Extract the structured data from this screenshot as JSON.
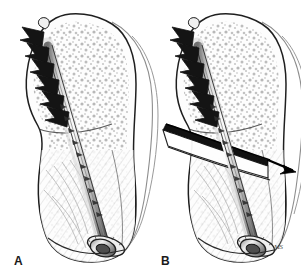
{
  "figure": {
    "background_color": "#ffffff",
    "ink_color": "#1a1a1a",
    "cancellous_stipple_color": "#9a9a9a",
    "cortex_fill_color": "#fbfbfb",
    "screw_shaft_color": "#c9c9c9",
    "screw_thread_color": "#1a1a1a",
    "arrow_color": "#000000",
    "fracture_color": "#111111"
  },
  "panels": [
    {
      "id": "A",
      "label": "A",
      "caption_text": "A",
      "description": "Bone with intact cannulated screw fixation spanning the medullary canal; threaded proximal head engaging cancellous bone, smooth shaft, washer and screw head seated at the distal cortex.",
      "state": "intact",
      "thread_count": 6,
      "has_fracture": false,
      "has_arrow": false,
      "has_washer": true
    },
    {
      "id": "B",
      "label": "B",
      "caption_text": "B",
      "description": "Same construct with an oblique fracture line crossing the bone and screw; the distal fragment is displaced laterally as indicated by the arrow.",
      "state": "fractured",
      "thread_count": 6,
      "has_fracture": true,
      "has_arrow": true,
      "has_washer": true,
      "arrow_direction": "lower-right",
      "fracture_orientation": "oblique"
    }
  ],
  "annotations": {
    "artist_signature": "MS"
  }
}
